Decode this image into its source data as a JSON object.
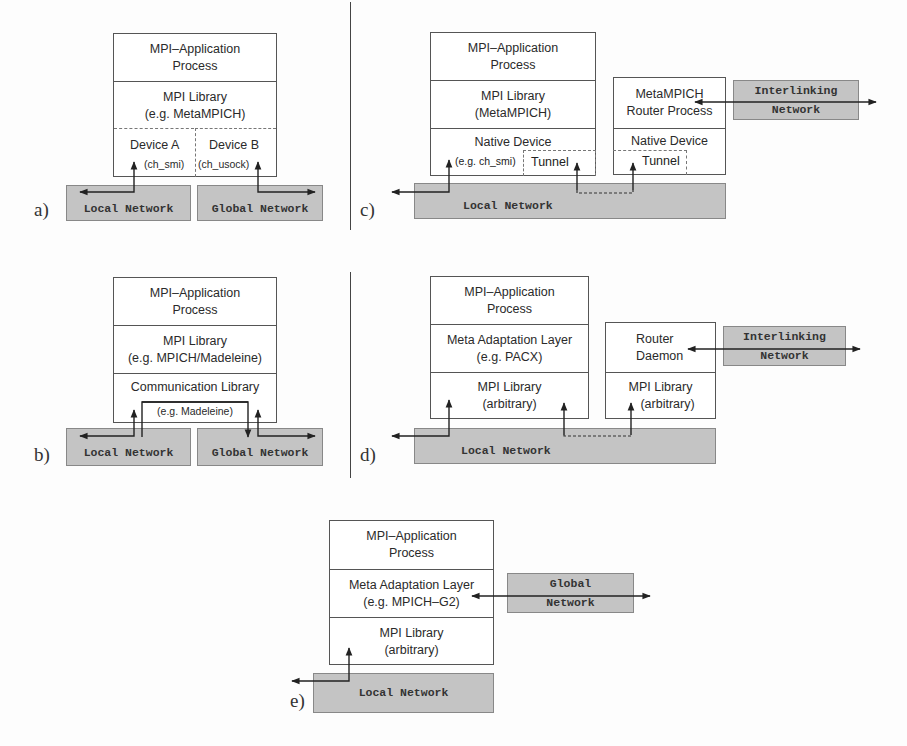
{
  "figure": {
    "panels": [
      {
        "id": "a",
        "label": "a)",
        "stack": {
          "app": [
            "MPI–Application",
            "Process"
          ],
          "library": [
            "MPI  Library",
            "(e.g. MetaMPICH)"
          ],
          "device_a": [
            "Device A",
            "(ch_smi)"
          ],
          "device_b": [
            "Device B",
            "(ch_usock)"
          ]
        },
        "networks": {
          "local": "Local Network",
          "global": "Global Network"
        }
      },
      {
        "id": "b",
        "label": "b)",
        "stack": {
          "app": [
            "MPI–Application",
            "Process"
          ],
          "library": [
            "MPI  Library",
            "(e.g. MPICH/Madeleine)"
          ],
          "comm": [
            "Communication Library",
            "(e.g. Madeleine)"
          ]
        },
        "networks": {
          "local": "Local Network",
          "global": "Global Network"
        }
      },
      {
        "id": "c",
        "label": "c)",
        "stack": {
          "app": [
            "MPI–Application",
            "Process"
          ],
          "library": [
            "MPI  Library",
            "(MetaMPICH)"
          ],
          "device": [
            "Native Device",
            "(e.g. ch_smi)",
            "Tunnel"
          ]
        },
        "router": {
          "process": [
            "MetaMPICH",
            "Router Process"
          ],
          "device": [
            "Native Device",
            "Tunnel"
          ]
        },
        "networks": {
          "local": "Local Network",
          "interlinking": [
            "Interlinking",
            "Network"
          ]
        }
      },
      {
        "id": "d",
        "label": "d)",
        "stack": {
          "app": [
            "MPI–Application",
            "Process"
          ],
          "meta": [
            "Meta Adaptation Layer",
            "(e.g. PACX)"
          ],
          "library": [
            "MPI  Library",
            "(arbitrary)"
          ]
        },
        "router": {
          "daemon": [
            "Router",
            "Daemon"
          ],
          "library": [
            "MPI  Library",
            "(arbitrary)"
          ]
        },
        "networks": {
          "local": "Local Network",
          "interlinking": [
            "Interlinking",
            "Network"
          ]
        }
      },
      {
        "id": "e",
        "label": "e)",
        "stack": {
          "app": [
            "MPI–Application",
            "Process"
          ],
          "meta": [
            "Meta Adaptation Layer",
            "(e.g. MPICH–G2)"
          ],
          "library": [
            "MPI  Library",
            "(arbitrary)"
          ]
        },
        "networks": {
          "local": "Local Network",
          "global": [
            "Global",
            "Network"
          ]
        }
      }
    ],
    "colors": {
      "network_fill": "#c4c4c4",
      "box_border": "#555555",
      "arrow": "#222222"
    }
  }
}
